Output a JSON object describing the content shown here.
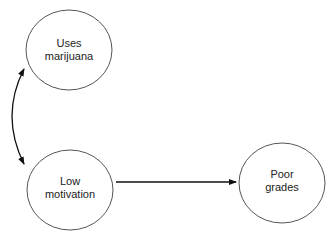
{
  "diagram": {
    "nodes": [
      {
        "id": "marijuana",
        "line1": "Uses",
        "line2": "marijuana"
      },
      {
        "id": "motivation",
        "line1": "Low",
        "line2": "motivation"
      },
      {
        "id": "grades",
        "line1": "Poor",
        "line2": "grades"
      }
    ],
    "edges": [
      {
        "from": "marijuana",
        "to": "motivation",
        "type": "bidirectional-curved"
      },
      {
        "from": "motivation",
        "to": "grades",
        "type": "directed"
      }
    ],
    "colors": {
      "stroke": "#555555",
      "arrow": "#111111",
      "text": "#222222"
    }
  }
}
